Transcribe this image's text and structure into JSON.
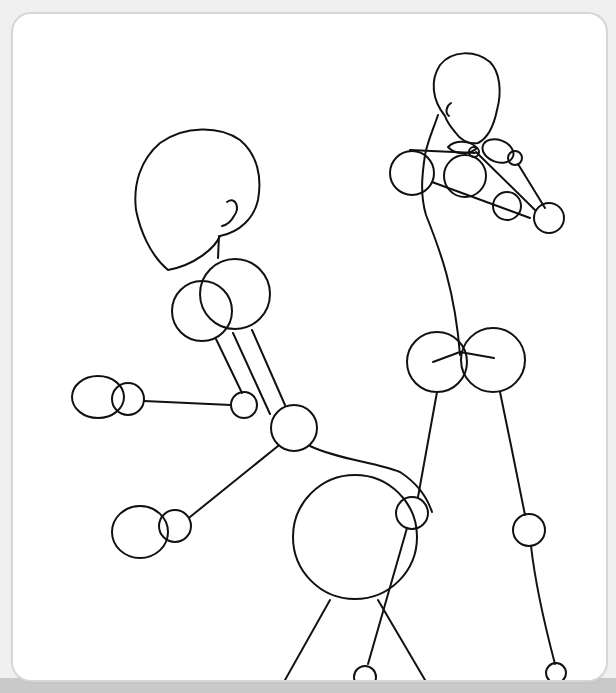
{
  "illustration": {
    "subject": "Two stick-figure mannequin sketches with joint circles",
    "stroke_color": "#111111",
    "card_background": "#ffffff",
    "page_background": "#f0f0f0",
    "bottom_band_color": "#c9c9c9",
    "figures": [
      {
        "name": "left-figure",
        "pose": "bent over, arms extended to the left"
      },
      {
        "name": "right-figure",
        "pose": "standing, arms crossed in front of chest"
      }
    ]
  }
}
